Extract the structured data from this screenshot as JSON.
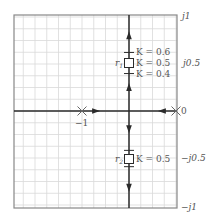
{
  "diagram": {
    "type": "root-locus",
    "plot_area": {
      "x": 14,
      "y": 15,
      "width": 163,
      "height": 193
    },
    "scale": {
      "origin_x": 176,
      "origin_y": 111,
      "px_per_unit_real": 94,
      "px_per_unit_imag": 96
    },
    "grid": {
      "spacing": 11.75,
      "color": "#d9d9d9",
      "border_color": "#888888"
    },
    "colors": {
      "locus": "#2b2b2b",
      "text": "#555555"
    },
    "real_axis_labels": [
      {
        "text": "−1",
        "value": -1
      },
      {
        "text": "0",
        "value": 0
      }
    ],
    "imag_axis_labels": [
      {
        "text": "j1",
        "value": 1
      },
      {
        "text": "j0.5",
        "value": 0.5
      },
      {
        "text": "−j0.5",
        "value": -0.5
      },
      {
        "text": "−j1",
        "value": -1
      }
    ],
    "poles": [
      {
        "name": "pole-minus-1",
        "real": -1,
        "imag": 0,
        "symbol": "×"
      },
      {
        "name": "pole-0",
        "real": 0,
        "imag": 0,
        "symbol": "×"
      }
    ],
    "breakaway": {
      "real": -0.5,
      "imag": 0
    },
    "roots": [
      {
        "label": "r",
        "subscript": "1",
        "real": -0.5,
        "imag": 0.5,
        "gain_label": "K = 0.5"
      },
      {
        "label": "r",
        "subscript": "2",
        "real": -0.5,
        "imag": -0.5,
        "gain_label": "K = 0.5"
      }
    ],
    "gain_ticks": [
      {
        "imag": 0.61,
        "label": "K = 0.6"
      },
      {
        "imag": 0.39,
        "label": "K = 0.4"
      },
      {
        "imag": -0.41,
        "label": ""
      },
      {
        "imag": -0.58,
        "label": ""
      }
    ],
    "arrows": [
      {
        "real": -0.85,
        "imag": 0,
        "dir": "right"
      },
      {
        "real": -0.15,
        "imag": 0,
        "dir": "left"
      },
      {
        "real": -0.5,
        "imag": 0.79,
        "dir": "up"
      },
      {
        "real": -0.5,
        "imag": 0.25,
        "dir": "up"
      },
      {
        "real": -0.5,
        "imag": -0.19,
        "dir": "down"
      },
      {
        "real": -0.5,
        "imag": -0.8,
        "dir": "down"
      }
    ]
  }
}
